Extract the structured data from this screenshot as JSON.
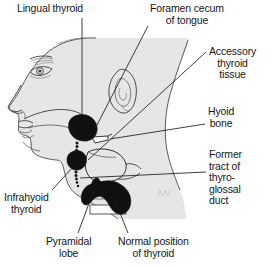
{
  "figure": {
    "artist_signature": "mark",
    "colors": {
      "background": "#ffffff",
      "silhouette_fill": "#e6e6e6",
      "outline": "#3a3a3a",
      "mass_fill": "#111111",
      "leader_line": "#1c1c1c",
      "text": "#161616"
    }
  },
  "labels": {
    "lingual_thyroid": "Lingual thyroid",
    "foramen_cecum": "Foramen cecum\nof tongue",
    "accessory_thyroid": "Accessory\nthyroid\ntissue",
    "hyoid_bone": "Hyoid\nbone",
    "former_tract": "Former\ntract of\nthyro-\nglossal\nduct",
    "infrahyoid_thyroid": "Infrahyoid\nthyroid",
    "pyramidal_lobe": "Pyramidal\nlobe",
    "normal_position": "Normal position\nof thyroid"
  },
  "anatomy": {
    "structures": [
      "head-profile-silhouette",
      "eyebrow",
      "eye",
      "nose",
      "lips",
      "ear",
      "tongue-outline",
      "hyoid-bone-outline",
      "thyroid-cartilage-outline",
      "trachea-outline",
      "sternocleidomastoid-contour"
    ],
    "ectopic_masses": [
      "lingual-thyroid-mass",
      "accessory-thyroid-mass",
      "infrahyoid-thyroid-mass",
      "normal-thyroid-gland-mass",
      "pyramidal-lobe-mass"
    ],
    "tract": "thyroglossal-duct-dotted-tract"
  }
}
